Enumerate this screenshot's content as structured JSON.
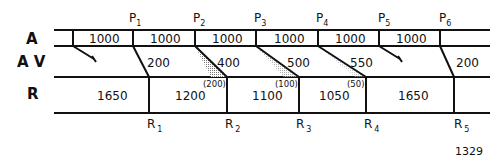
{
  "rows": {
    "a_label": "A",
    "av_label": "A V",
    "r_label": "R"
  },
  "p_markers": [
    {
      "letter": "P",
      "sub": "1"
    },
    {
      "letter": "P",
      "sub": "2"
    },
    {
      "letter": "P",
      "sub": "3"
    },
    {
      "letter": "P",
      "sub": "4"
    },
    {
      "letter": "P",
      "sub": "5"
    },
    {
      "letter": "P",
      "sub": "6"
    }
  ],
  "a_values": [
    "1000",
    "1000",
    "1000",
    "1000",
    "1000",
    "1000"
  ],
  "av_values": [
    "200",
    "400",
    "500",
    "550",
    "200"
  ],
  "r_values": [
    "1650",
    "1200",
    "1100",
    "1050",
    "1650"
  ],
  "r_deficits": [
    "(200)",
    "(100)",
    "(50)"
  ],
  "r_markers": [
    {
      "letter": "R",
      "sub": "1"
    },
    {
      "letter": "R",
      "sub": "2"
    },
    {
      "letter": "R",
      "sub": "3"
    },
    {
      "letter": "R",
      "sub": "4"
    },
    {
      "letter": "R",
      "sub": "5"
    }
  ],
  "figure_number": "1329",
  "colors": {
    "line": "#111111",
    "shade": "#9a9a9a"
  }
}
